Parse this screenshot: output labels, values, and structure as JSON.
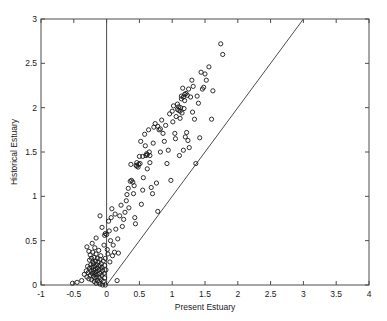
{
  "chart_data": {
    "type": "scatter",
    "title": "",
    "xlabel": "Present Estuary",
    "ylabel": "Historical Estuary",
    "xlim": [
      -1,
      4
    ],
    "ylim": [
      0,
      3
    ],
    "xticks": [
      -1,
      -0.5,
      0,
      0.5,
      1,
      1.5,
      2,
      2.5,
      3,
      3.5,
      4
    ],
    "xticklabels": [
      "-1",
      "-0.5",
      "0",
      "0.5",
      "1",
      "1.5",
      "2",
      "2.5",
      "3",
      "3.5",
      "4"
    ],
    "yticks": [
      0,
      0.5,
      1,
      1.5,
      2,
      2.5,
      3
    ],
    "yticklabels": [
      "0",
      "0.5",
      "1",
      "1.5",
      "2",
      "2.5",
      "3"
    ],
    "grid": false,
    "legend": null,
    "marker": "open-circle",
    "marker_size": 4.2,
    "marker_color": "#1a1a1a",
    "axis_color": "#4d4d4d",
    "reference_lines": [
      {
        "name": "identity-line",
        "from": [
          0,
          0
        ],
        "to": [
          3,
          3
        ],
        "color": "#4d4d4d",
        "description": "y = x one-to-one line"
      },
      {
        "name": "zero-vertical-line",
        "from": [
          0,
          0
        ],
        "to": [
          0,
          3
        ],
        "color": "#4d4d4d",
        "description": "vertical line at x = 0"
      }
    ],
    "points": [
      [
        -0.52,
        0.02
      ],
      [
        -0.45,
        0.03
      ],
      [
        -0.38,
        0.05
      ],
      [
        -0.34,
        0.12
      ],
      [
        -0.31,
        0.16
      ],
      [
        -0.3,
        0.09
      ],
      [
        -0.29,
        0.21
      ],
      [
        -0.28,
        0.14
      ],
      [
        -0.27,
        0.07
      ],
      [
        -0.26,
        0.19
      ],
      [
        -0.26,
        0.28
      ],
      [
        -0.25,
        0.11
      ],
      [
        -0.25,
        0.34
      ],
      [
        -0.24,
        0.23
      ],
      [
        -0.24,
        0.16
      ],
      [
        -0.23,
        0.06
      ],
      [
        -0.23,
        0.3
      ],
      [
        -0.22,
        0.13
      ],
      [
        -0.22,
        0.2
      ],
      [
        -0.21,
        0.26
      ],
      [
        -0.21,
        0.37
      ],
      [
        -0.2,
        0.1
      ],
      [
        -0.2,
        0.17
      ],
      [
        -0.2,
        0.24
      ],
      [
        -0.19,
        0.04
      ],
      [
        -0.19,
        0.14
      ],
      [
        -0.19,
        0.31
      ],
      [
        -0.18,
        0.08
      ],
      [
        -0.18,
        0.21
      ],
      [
        -0.18,
        0.42
      ],
      [
        -0.17,
        0.12
      ],
      [
        -0.17,
        0.18
      ],
      [
        -0.17,
        0.27
      ],
      [
        -0.16,
        0.02
      ],
      [
        -0.16,
        0.15
      ],
      [
        -0.16,
        0.35
      ],
      [
        -0.15,
        0.09
      ],
      [
        -0.15,
        0.23
      ],
      [
        -0.14,
        0.05
      ],
      [
        -0.14,
        0.19
      ],
      [
        -0.14,
        0.3
      ],
      [
        -0.13,
        0.12
      ],
      [
        -0.13,
        0.26
      ],
      [
        -0.12,
        0.03
      ],
      [
        -0.12,
        0.17
      ],
      [
        -0.12,
        0.39
      ],
      [
        -0.11,
        0.08
      ],
      [
        -0.11,
        0.22
      ],
      [
        -0.1,
        0.13
      ],
      [
        -0.1,
        0.29
      ],
      [
        -0.1,
        0.01
      ],
      [
        -0.09,
        0.18
      ],
      [
        -0.09,
        0.33
      ],
      [
        -0.08,
        0.06
      ],
      [
        -0.08,
        0.24
      ],
      [
        -0.07,
        0.11
      ],
      [
        -0.07,
        0.2
      ],
      [
        -0.06,
        0.0
      ],
      [
        -0.06,
        0.16
      ],
      [
        -0.05,
        0.27
      ],
      [
        -0.05,
        0.04
      ],
      [
        -0.04,
        0.13
      ],
      [
        -0.04,
        0.45
      ],
      [
        -0.03,
        0.22
      ],
      [
        -0.03,
        0.08
      ],
      [
        -0.02,
        0.3
      ],
      [
        -0.02,
        0.0
      ],
      [
        -0.01,
        0.17
      ],
      [
        -0.3,
        0.43
      ],
      [
        -0.27,
        0.38
      ],
      [
        -0.22,
        0.47
      ],
      [
        -0.16,
        0.53
      ],
      [
        -0.1,
        0.78
      ],
      [
        -0.07,
        0.65
      ],
      [
        -0.03,
        0.56
      ],
      [
        -0.02,
        0.58
      ],
      [
        0.0,
        0.57
      ],
      [
        0.01,
        0.4
      ],
      [
        0.02,
        0.35
      ],
      [
        0.03,
        0.72
      ],
      [
        0.04,
        0.61
      ],
      [
        0.05,
        0.26
      ],
      [
        0.06,
        0.5
      ],
      [
        0.07,
        0.76
      ],
      [
        0.08,
        0.86
      ],
      [
        0.09,
        0.33
      ],
      [
        0.1,
        0.45
      ],
      [
        0.12,
        0.37
      ],
      [
        0.13,
        0.8
      ],
      [
        0.14,
        0.63
      ],
      [
        0.16,
        0.05
      ],
      [
        0.17,
        0.52
      ],
      [
        0.18,
        0.36
      ],
      [
        0.2,
        0.78
      ],
      [
        0.22,
        0.9
      ],
      [
        0.24,
        0.66
      ],
      [
        0.26,
        0.74
      ],
      [
        0.28,
        0.82
      ],
      [
        0.3,
        0.95
      ],
      [
        0.31,
        1.02
      ],
      [
        0.33,
        1.09
      ],
      [
        0.34,
        0.87
      ],
      [
        0.36,
        1.17
      ],
      [
        0.37,
        1.36
      ],
      [
        0.38,
        1.18
      ],
      [
        0.4,
        1.16
      ],
      [
        0.41,
        1.03
      ],
      [
        0.42,
        1.12
      ],
      [
        0.43,
        0.76
      ],
      [
        0.44,
        0.69
      ],
      [
        0.45,
        1.35
      ],
      [
        0.46,
        1.38
      ],
      [
        0.48,
        1.33
      ],
      [
        0.5,
        1.45
      ],
      [
        0.51,
        1.37
      ],
      [
        0.52,
        1.62
      ],
      [
        0.53,
        0.91
      ],
      [
        0.55,
        1.07
      ],
      [
        0.56,
        1.21
      ],
      [
        0.58,
        1.7
      ],
      [
        0.59,
        1.57
      ],
      [
        0.6,
        1.46
      ],
      [
        0.61,
        1.48
      ],
      [
        0.62,
        1.31
      ],
      [
        0.64,
        1.75
      ],
      [
        0.65,
        1.5
      ],
      [
        0.66,
        1.38
      ],
      [
        0.68,
        1.1
      ],
      [
        0.7,
        1.03
      ],
      [
        0.71,
        1.6
      ],
      [
        0.72,
        1.78
      ],
      [
        0.74,
        1.82
      ],
      [
        0.76,
        1.15
      ],
      [
        0.78,
        0.83
      ],
      [
        0.8,
        1.75
      ],
      [
        0.82,
        1.5
      ],
      [
        0.84,
        1.86
      ],
      [
        0.86,
        1.71
      ],
      [
        0.88,
        1.62
      ],
      [
        0.9,
        1.8
      ],
      [
        0.92,
        1.37
      ],
      [
        0.94,
        1.52
      ],
      [
        0.96,
        1.93
      ],
      [
        0.98,
        1.18
      ],
      [
        1.0,
        1.96
      ],
      [
        1.01,
        1.84
      ],
      [
        1.02,
        2.02
      ],
      [
        1.04,
        1.71
      ],
      [
        1.05,
        1.65
      ],
      [
        1.06,
        1.9
      ],
      [
        1.08,
        2.04
      ],
      [
        1.1,
        1.97
      ],
      [
        1.11,
        1.46
      ],
      [
        1.12,
        1.88
      ],
      [
        1.13,
        2.0
      ],
      [
        1.14,
        2.13
      ],
      [
        1.15,
        1.94
      ],
      [
        1.16,
        2.22
      ],
      [
        1.17,
        1.52
      ],
      [
        1.18,
        1.99
      ],
      [
        1.19,
        2.08
      ],
      [
        1.2,
        1.67
      ],
      [
        1.21,
        2.16
      ],
      [
        1.22,
        1.72
      ],
      [
        1.23,
        2.14
      ],
      [
        1.24,
        1.63
      ],
      [
        1.25,
        2.21
      ],
      [
        1.26,
        1.55
      ],
      [
        1.28,
        2.12
      ],
      [
        1.3,
        2.31
      ],
      [
        1.31,
        1.95
      ],
      [
        1.32,
        2.24
      ],
      [
        1.34,
        1.87
      ],
      [
        1.36,
        1.37
      ],
      [
        1.38,
        2.13
      ],
      [
        1.4,
        2.05
      ],
      [
        1.42,
        1.66
      ],
      [
        1.44,
        2.4
      ],
      [
        1.46,
        2.21
      ],
      [
        1.48,
        2.23
      ],
      [
        1.5,
        2.38
      ],
      [
        1.52,
        2.31
      ],
      [
        1.56,
        2.46
      ],
      [
        1.6,
        1.87
      ],
      [
        1.62,
        2.19
      ],
      [
        1.74,
        2.72
      ],
      [
        1.77,
        2.6
      ],
      [
        0.55,
        1.45
      ],
      [
        0.62,
        1.47
      ],
      [
        0.66,
        1.46
      ],
      [
        1.08,
        1.98
      ],
      [
        1.1,
        2.01
      ],
      [
        1.12,
        1.96
      ],
      [
        1.14,
        2.1
      ],
      [
        1.17,
        2.12
      ],
      [
        1.19,
        2.15
      ],
      [
        0.78,
        1.79
      ],
      [
        0.82,
        1.76
      ],
      [
        0.46,
        1.34
      ],
      [
        0.49,
        1.36
      ]
    ]
  },
  "figure": {
    "background_color": "#ffffff",
    "axes_box": true
  }
}
